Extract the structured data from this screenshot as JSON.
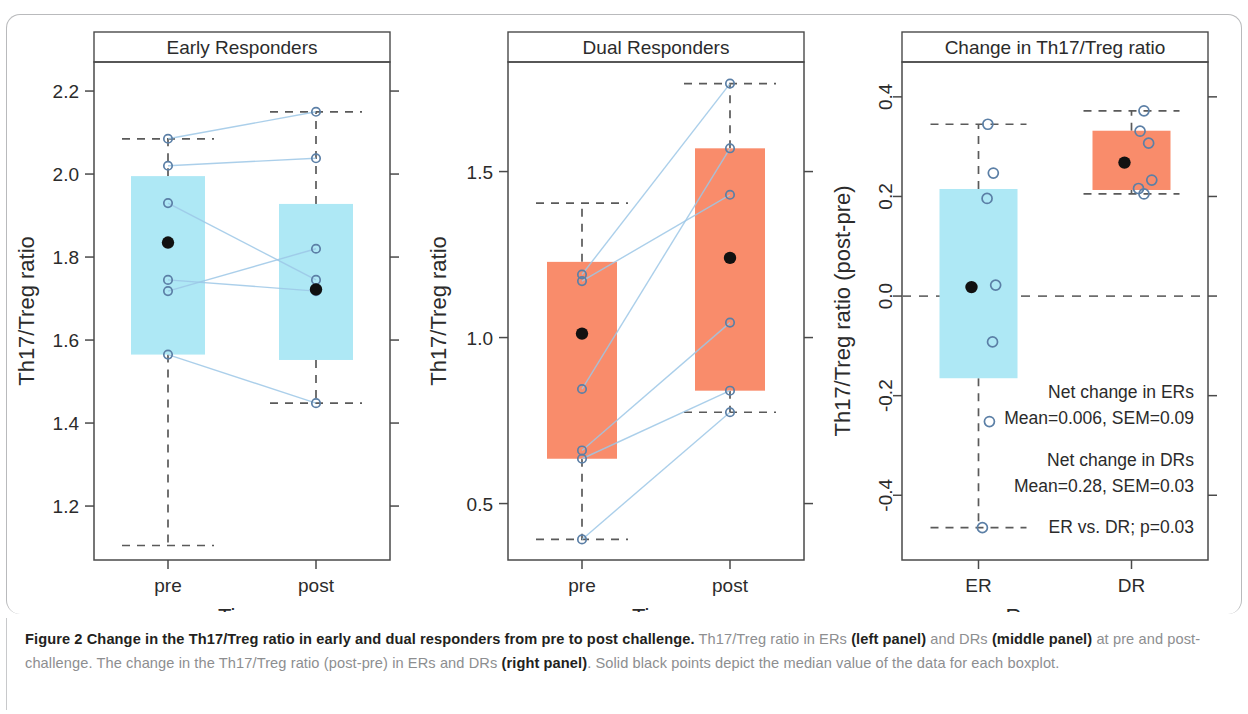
{
  "figure": {
    "caption_label": "Figure 2",
    "caption_title": "Change in the Th17/Treg ratio in early and dual responders from pre to post challenge.",
    "caption_part1": " Th17/Treg ratio in ERs ",
    "caption_bold1": "(left panel)",
    "caption_part2": " and DRs ",
    "caption_bold2": "(middle panel)",
    "caption_part3": " at pre and post-challenge. The change in the Th17/Treg ratio (post-pre) in ERs and DRs ",
    "caption_bold3": "(right panel)",
    "caption_part4": ". Solid black points depict the median value of the data for each boxplot."
  },
  "colors": {
    "er_fill": "#aee8f5",
    "dr_fill": "#f98c6b",
    "link_line": "#9cc7e6",
    "open_point": "#5b7fa6",
    "median_point": "#111111",
    "axis": "#4a4a4a"
  },
  "chart_data": [
    {
      "id": "early-responders",
      "type": "box",
      "title": "Early Responders",
      "xlabel": "Time",
      "ylabel": "Th17/Treg ratio",
      "categories": [
        "pre",
        "post"
      ],
      "yticks": [
        2.2,
        2.0,
        1.8,
        1.6,
        1.4,
        1.2
      ],
      "ytick_labels": [
        "2.2",
        "2.0",
        "1.8",
        "1.6",
        "1.4",
        "1.2"
      ],
      "ylim": [
        1.07,
        2.27
      ],
      "boxes": [
        {
          "category": "pre",
          "q1": 1.565,
          "q3": 1.995,
          "median": 1.835,
          "whisker_low": 1.105,
          "whisker_high": 2.085
        },
        {
          "category": "post",
          "q1": 1.552,
          "q3": 1.928,
          "median": 1.722,
          "whisker_low": 1.448,
          "whisker_high": 2.15
        }
      ],
      "paired_points": [
        {
          "pre": 2.085,
          "post": 2.15
        },
        {
          "pre": 2.02,
          "post": 2.038
        },
        {
          "pre": 1.93,
          "post": 1.745
        },
        {
          "pre": 1.718,
          "post": 1.82
        },
        {
          "pre": 1.745,
          "post": 1.718
        },
        {
          "pre": 1.565,
          "post": 1.448
        }
      ]
    },
    {
      "id": "dual-responders",
      "type": "box",
      "title": "Dual Responders",
      "xlabel": "Time",
      "ylabel": "Th17/Treg ratio",
      "categories": [
        "pre",
        "post"
      ],
      "yticks": [
        1.5,
        1.0,
        0.5
      ],
      "ytick_labels": [
        "1.5",
        "1.0",
        "0.5"
      ],
      "ylim": [
        0.33,
        1.83
      ],
      "boxes": [
        {
          "category": "pre",
          "q1": 0.635,
          "q3": 1.228,
          "median": 1.012,
          "whisker_low": 0.392,
          "whisker_high": 1.405
        },
        {
          "category": "post",
          "q1": 0.84,
          "q3": 1.57,
          "median": 1.24,
          "whisker_low": 0.775,
          "whisker_high": 1.765
        }
      ],
      "paired_points": [
        {
          "pre": 1.19,
          "post": 1.765
        },
        {
          "pre": 1.17,
          "post": 1.43
        },
        {
          "pre": 0.845,
          "post": 1.57
        },
        {
          "pre": 0.66,
          "post": 1.045
        },
        {
          "pre": 0.635,
          "post": 0.84
        },
        {
          "pre": 0.392,
          "post": 0.775
        }
      ]
    },
    {
      "id": "change-in-ratio",
      "type": "box",
      "title": "Change in Th17/Treg ratio",
      "xlabel": "Response",
      "ylabel": "Th17/Treg ratio (post-pre)",
      "categories": [
        "ER",
        "DR"
      ],
      "yticks": [
        0.4,
        0.2,
        0.0,
        -0.2,
        -0.4
      ],
      "ytick_labels": [
        "0.4",
        "0.2",
        "0.0",
        "-0.2",
        "-0.4"
      ],
      "ylim": [
        -0.53,
        0.47
      ],
      "zero_reference": 0.0,
      "boxes": [
        {
          "category": "ER",
          "q1": -0.165,
          "q3": 0.215,
          "median": 0.018,
          "whisker_low": -0.465,
          "whisker_high": 0.345
        },
        {
          "category": "DR",
          "q1": 0.213,
          "q3": 0.332,
          "median": 0.268,
          "whisker_low": 0.205,
          "whisker_high": 0.372
        }
      ],
      "points": [
        {
          "category": "ER",
          "value": 0.345,
          "jitter": -0.02
        },
        {
          "category": "ER",
          "value": 0.247,
          "jitter": 0.05
        },
        {
          "category": "ER",
          "value": 0.196,
          "jitter": -0.03
        },
        {
          "category": "ER",
          "value": 0.022,
          "jitter": 0.08
        },
        {
          "category": "ER",
          "value": -0.092,
          "jitter": 0.04
        },
        {
          "category": "ER",
          "value": -0.252,
          "jitter": 0.0
        },
        {
          "category": "ER",
          "value": -0.465,
          "jitter": -0.09
        },
        {
          "category": "DR",
          "value": 0.372,
          "jitter": 0.02
        },
        {
          "category": "DR",
          "value": 0.331,
          "jitter": -0.03
        },
        {
          "category": "DR",
          "value": 0.307,
          "jitter": 0.08
        },
        {
          "category": "DR",
          "value": 0.233,
          "jitter": 0.12
        },
        {
          "category": "DR",
          "value": 0.216,
          "jitter": -0.05
        },
        {
          "category": "DR",
          "value": 0.205,
          "jitter": 0.02
        }
      ],
      "annotations": [
        "Net change in ERs",
        "Mean=0.006, SEM=0.09",
        "Net change in DRs",
        "Mean=0.28, SEM=0.03",
        "ER vs. DR; p=0.03"
      ]
    }
  ]
}
